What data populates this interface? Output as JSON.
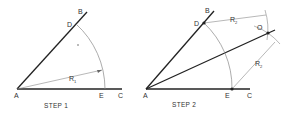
{
  "step1": {
    "caption": "STEP 1",
    "labels": {
      "A": "A",
      "B": "B",
      "C": "C",
      "D": "D",
      "E": "E",
      "R": "R",
      "R_sub": "1"
    }
  },
  "step2": {
    "caption": "STEP 2",
    "labels": {
      "A": "A",
      "B": "B",
      "C": "C",
      "D": "D",
      "E": "E",
      "O": "O",
      "R_top": "R",
      "R_top_sub": "2",
      "R_right": "R",
      "R_right_sub": "2"
    }
  },
  "colors": {
    "line": "#222222",
    "arc": "#888888",
    "text": "#333333"
  }
}
